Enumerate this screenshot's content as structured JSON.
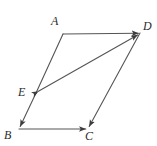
{
  "figure": {
    "kind": "geometry-diagram",
    "background_color": "#ffffff",
    "stroke_color": "#555555",
    "label_color": "#2b2b2b",
    "stroke_width": 1.1,
    "width": 157,
    "height": 146,
    "points": [
      {
        "name": "A",
        "label": "A",
        "x": 63,
        "y": 34,
        "label_x": 51,
        "label_y": 15
      },
      {
        "name": "D",
        "label": "D",
        "x": 140,
        "y": 33,
        "label_x": 143,
        "label_y": 20
      },
      {
        "name": "E",
        "label": "E",
        "x": 36,
        "y": 93,
        "label_x": 18,
        "label_y": 86
      },
      {
        "name": "B",
        "label": "B",
        "x": 19,
        "y": 129,
        "label_x": 4,
        "label_y": 129
      },
      {
        "name": "C",
        "label": "C",
        "x": 88,
        "y": 129,
        "label_x": 85,
        "label_y": 130
      }
    ],
    "segments": [
      {
        "name": "side-AD",
        "from": "A",
        "to": "D",
        "arrow": "end"
      },
      {
        "name": "side-AE",
        "from": "A",
        "to": "E",
        "arrow": "none"
      },
      {
        "name": "side-EB",
        "from": "E",
        "to": "B",
        "arrow": "end"
      },
      {
        "name": "side-BC",
        "from": "B",
        "to": "C",
        "arrow": "end"
      },
      {
        "name": "side-DC",
        "from": "D",
        "to": "C",
        "arrow": "end"
      },
      {
        "name": "diagonal-ED",
        "from": "E",
        "to": "D",
        "arrow": "both"
      }
    ]
  }
}
